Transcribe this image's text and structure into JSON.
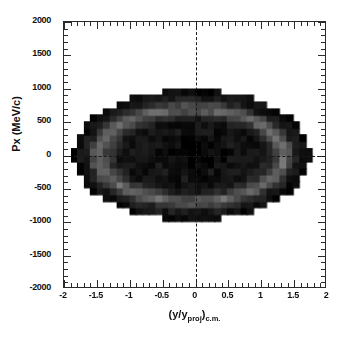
{
  "chart_data": {
    "type": "heatmap",
    "title": "",
    "subtitle": "",
    "xlabel": "(y/y_proj)_c.m.",
    "ylabel": "Px  (MeV/c)",
    "xlim": [
      -2,
      2
    ],
    "ylim": [
      -2000,
      2000
    ],
    "xticks": [
      "-2",
      "-1.5",
      "-1",
      "-0.5",
      "0",
      "0.5",
      "1",
      "1.5",
      "2"
    ],
    "xtick_values": [
      -2,
      -1.5,
      -1,
      -0.5,
      0,
      0.5,
      1,
      1.5,
      2
    ],
    "yticks": [
      "2000",
      "1500",
      "1000",
      "500",
      "0",
      "-500",
      "-1000",
      "-1500",
      "-2000"
    ],
    "ytick_values": [
      2000,
      1500,
      1000,
      500,
      0,
      -500,
      -1000,
      -1500,
      -2000
    ],
    "minor_ticks_per_interval": 5,
    "grid": false,
    "legend": null,
    "colormap": "grayscale-inverted",
    "background_color": "#ffffff",
    "foreground_color": "#111111",
    "reference_lines": [
      {
        "axis": "x",
        "value": 0,
        "style": "dashed",
        "color": "#1a1a1a"
      },
      {
        "axis": "y",
        "value": 0,
        "style": "dashed",
        "color": "#1a1a1a"
      }
    ],
    "bin_size_x": 0.1,
    "bin_size_y": 100,
    "distribution": {
      "center_x": -0.05,
      "center_y": 0,
      "outer_semi_axis_x": 1.82,
      "outer_semi_axis_y": 980,
      "ring_semi_axis_x": 1.42,
      "ring_semi_axis_y": 700,
      "core_semi_axis_x": 1.05,
      "core_semi_axis_y": 470,
      "peak_intensity": 1.0,
      "ring_intensity": 0.55,
      "core_intensity": 0.93,
      "edge_intensity": 0.88
    },
    "data_extent": {
      "x_min": -2.0,
      "x_max": 1.82,
      "y_min": -1000,
      "y_max": 1000
    }
  },
  "axes": {
    "x_title_main": "(y/y",
    "x_title_sub1": "proj",
    "x_title_mid": ")",
    "x_title_sub2": "c.m.",
    "y_title": "Px  (MeV/c)"
  }
}
